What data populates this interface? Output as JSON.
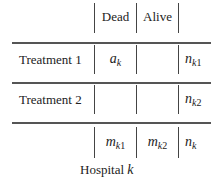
{
  "table": {
    "header": {
      "col1": "Dead",
      "col2": "Alive"
    },
    "rows": [
      {
        "label": "Treatment 1",
        "dead": {
          "base": "a",
          "sub": "k"
        },
        "alive": "",
        "total": {
          "base": "n",
          "sub_italic": "k",
          "sub_upright": "1"
        }
      },
      {
        "label": "Treatment 2",
        "dead": "",
        "alive": "",
        "total": {
          "base": "n",
          "sub_italic": "k",
          "sub_upright": "2"
        }
      }
    ],
    "footer": {
      "col1": {
        "base": "m",
        "sub_italic": "k",
        "sub_upright": "1"
      },
      "col2": {
        "base": "m",
        "sub_italic": "k",
        "sub_upright": "2"
      },
      "total": {
        "base": "n",
        "sub_italic": "k",
        "sub_upright": ""
      }
    },
    "caption": {
      "text": "Hospital",
      "var": "k"
    }
  },
  "colors": {
    "text": "#222222",
    "rules": "#555555",
    "background": "#ffffff"
  }
}
